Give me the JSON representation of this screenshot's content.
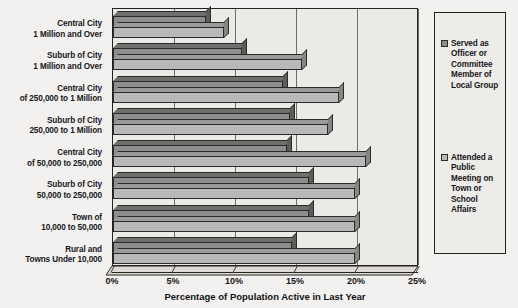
{
  "chart_data": {
    "type": "bar",
    "orientation": "horizontal",
    "title": "",
    "xlabel": "Percentage of Population Active in Last Year",
    "ylabel": "",
    "xlim": [
      0,
      25
    ],
    "xticks": [
      "0%",
      "5%",
      "10%",
      "15%",
      "20%",
      "25%"
    ],
    "xtick_values": [
      0,
      5,
      10,
      15,
      20,
      25
    ],
    "grid": true,
    "legend_position": "right",
    "categories": [
      [
        "Central City",
        "1 Million and Over"
      ],
      [
        "Suburb of City",
        "1 Million and Over"
      ],
      [
        "Central City",
        "of 250,000 to 1 Million"
      ],
      [
        "Suburb of City",
        "250,000 to 1 Million"
      ],
      [
        "Central City",
        "of 50,000 to 250,000"
      ],
      [
        "Suburb of City",
        "50,000 to 250,000"
      ],
      [
        "Town of",
        "10,000 to 50,000"
      ],
      [
        "Rural and",
        "Towns Under 10,000"
      ]
    ],
    "series": [
      {
        "name": [
          "Served as",
          "Officer or",
          "Committee",
          "Member of",
          "Local Group"
        ],
        "color": "#8e8e8e",
        "values": [
          7.6,
          10.6,
          13.9,
          14.5,
          14.3,
          16.1,
          16.1,
          14.7
        ]
      },
      {
        "name": [
          "Attended a",
          "Public",
          "Meeting on",
          "Town or",
          "School",
          "Affairs"
        ],
        "color": "#b9b9b9",
        "values": [
          9.1,
          15.5,
          18.5,
          17.6,
          20.7,
          19.8,
          19.8,
          19.8
        ]
      }
    ]
  },
  "colors": {
    "series_dark": "#8e8e8e",
    "series_light": "#b9b9b9",
    "outline": "#23231f",
    "background": "#f2f1ef",
    "plot_background": "#eceae6"
  }
}
